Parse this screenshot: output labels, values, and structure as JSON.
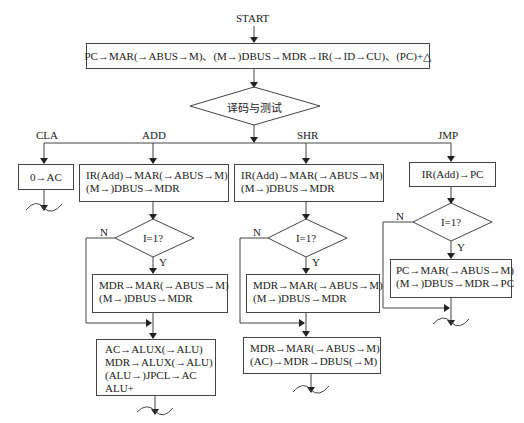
{
  "start_label": "START",
  "fetch_box": "PC→MAR(→ABUS→M)、(M→)DBUS→MDR→IR(→ID→CU)、(PC)+△",
  "decode_diamond": "译码与测试",
  "branches": {
    "cla": {
      "label": "CLA",
      "box1": [
        "0→AC"
      ]
    },
    "add": {
      "label": "ADD",
      "box1": [
        "IR(Add)→MAR(→ABUS→M)",
        "(M→)DBUS→MDR"
      ],
      "decision": "I=1?",
      "no_label": "N",
      "yes_label": "Y",
      "indirect_box": [
        "MDR→MAR(→ABUS→M)",
        "(M→)DBUS→MDR"
      ],
      "exec_box": [
        "AC→ALUX(→ALU)",
        "MDR→ALUX(→ALU)",
        "(ALU→)JPCL→AC",
        "ALU+"
      ]
    },
    "shr": {
      "label": "SHR",
      "box1": [
        "IR(Add)→MAR(→ABUS→M)",
        "(M→)DBUS→MDR"
      ],
      "decision": "I=1?",
      "no_label": "N",
      "yes_label": "Y",
      "indirect_box": [
        "MDR→MAR(→ABUS→M)",
        "(M→)DBUS→MDR"
      ],
      "exec_box": [
        "MDR→MAR(→ABUS→M)",
        "(AC)→MDR→DBUS(→M)"
      ]
    },
    "jmp": {
      "label": "JMP",
      "box1": [
        "IR(Add)→PC"
      ],
      "decision": "I=1?",
      "no_label": "N",
      "yes_label": "Y",
      "indirect_box": [
        "PC→MAR(→ABUS→M)",
        "(M→)DBUS→MDR→PC"
      ]
    }
  }
}
